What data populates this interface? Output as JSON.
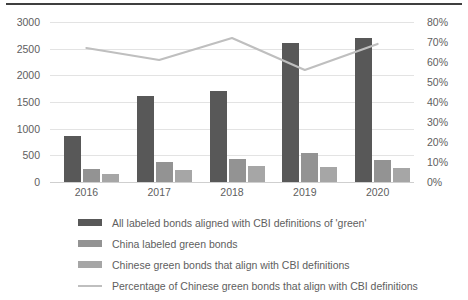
{
  "chart_data": {
    "type": "bar",
    "title": "",
    "subtitle": "",
    "xlabel": "",
    "ylabel": "",
    "y2label": "",
    "categories": [
      "2016",
      "2017",
      "2018",
      "2019",
      "2020"
    ],
    "ylim": [
      0,
      3000
    ],
    "y2lim": [
      0,
      0.8
    ],
    "yticks": [
      "0",
      "500",
      "1000",
      "1500",
      "2000",
      "2500",
      "3000"
    ],
    "y2ticks": [
      "0%",
      "10%",
      "20%",
      "30%",
      "40%",
      "50%",
      "60%",
      "70%",
      "80%"
    ],
    "grid": true,
    "legend_position": "bottom",
    "series": [
      {
        "name": "All labeled bonds aligned with CBI definitions of 'green'",
        "type": "bar",
        "axis": "left",
        "color": "#585858",
        "values": [
          870,
          1620,
          1700,
          2600,
          2700
        ]
      },
      {
        "name": "China labeled green bonds",
        "type": "bar",
        "axis": "left",
        "color": "#939393",
        "values": [
          240,
          370,
          430,
          550,
          420
        ]
      },
      {
        "name": "Chinese green bonds that align with CBI definitions",
        "type": "bar",
        "axis": "left",
        "color": "#a6a6a6",
        "values": [
          150,
          220,
          300,
          290,
          270
        ]
      },
      {
        "name": "Percentage of Chinese green bonds that align with CBI definitions",
        "type": "line",
        "axis": "right",
        "color": "#bfbfbf",
        "values": [
          0.67,
          0.61,
          0.72,
          0.56,
          0.69
        ]
      }
    ]
  },
  "legend": {
    "items": [
      {
        "label": "All labeled bonds aligned with CBI definitions of 'green'",
        "marker": "bar-swatch-dark"
      },
      {
        "label": "China labeled green bonds",
        "marker": "bar-swatch-mid"
      },
      {
        "label": "Chinese green bonds that align with CBI definitions",
        "marker": "bar-swatch-light"
      },
      {
        "label": "Percentage of Chinese green bonds that align with CBI definitions",
        "marker": "line-swatch"
      }
    ]
  }
}
